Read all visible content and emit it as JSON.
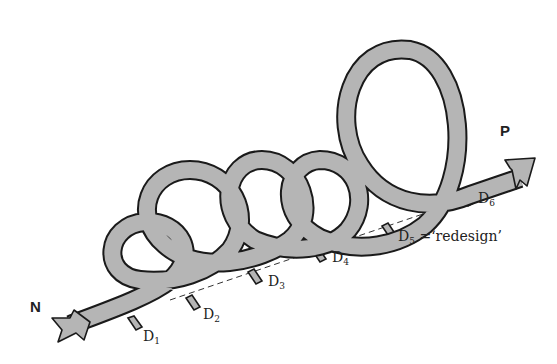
{
  "diagram": {
    "start_label": "N",
    "end_label": "P",
    "stages": [
      {
        "id": "D1",
        "base": "D",
        "sub": "1",
        "note": ""
      },
      {
        "id": "D2",
        "base": "D",
        "sub": "2",
        "note": ""
      },
      {
        "id": "D3",
        "base": "D",
        "sub": "3",
        "note": ""
      },
      {
        "id": "D4",
        "base": "D",
        "sub": "4",
        "note": ""
      },
      {
        "id": "D5",
        "base": "D",
        "sub": "5",
        "note": " =‘redesign’"
      },
      {
        "id": "D6",
        "base": "D",
        "sub": "6",
        "note": ""
      }
    ],
    "colors": {
      "band": "#b5b5b5",
      "outline": "#1a1a1a",
      "background": "#ffffff"
    },
    "loop_count": 5
  }
}
